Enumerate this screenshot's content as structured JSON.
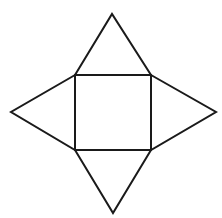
{
  "diagram": {
    "background": "#ffffff",
    "stroke_color": "#1a1a1a",
    "stroke_width": 2,
    "square_base": {
      "points": [
        [
          75,
          75
        ],
        [
          151,
          75
        ],
        [
          151,
          150
        ],
        [
          75,
          150
        ]
      ]
    },
    "triangles": [
      {
        "name": "top-triangle",
        "points": [
          [
            75,
            75
          ],
          [
            112,
            14
          ],
          [
            151,
            75
          ]
        ]
      },
      {
        "name": "right-triangle",
        "points": [
          [
            151,
            75
          ],
          [
            216,
            112
          ],
          [
            151,
            150
          ]
        ]
      },
      {
        "name": "bottom-triangle",
        "points": [
          [
            75,
            150
          ],
          [
            113,
            213
          ],
          [
            151,
            150
          ]
        ]
      },
      {
        "name": "left-triangle",
        "points": [
          [
            75,
            75
          ],
          [
            11,
            112
          ],
          [
            75,
            150
          ]
        ]
      }
    ]
  }
}
